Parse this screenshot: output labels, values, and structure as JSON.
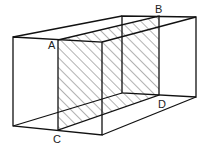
{
  "diagram": {
    "labels": {
      "A": "A",
      "B": "B",
      "C": "C",
      "D": "D"
    },
    "colors": {
      "stroke": "#111111",
      "hatch": "#555555",
      "background": "#ffffff"
    },
    "vertices": {
      "front_top_left": [
        13,
        37
      ],
      "front_top_right": [
        102,
        42
      ],
      "front_bottom_left": [
        13,
        126
      ],
      "front_bottom_right": [
        102,
        135
      ],
      "back_top_left": [
        122,
        16
      ],
      "back_top_right": [
        196,
        17
      ],
      "back_bottom_left": [
        122,
        93
      ],
      "back_bottom_right": [
        196,
        97
      ],
      "A": [
        58,
        40
      ],
      "B": [
        159,
        16
      ],
      "C": [
        58,
        130
      ],
      "D": [
        159,
        95
      ]
    }
  }
}
